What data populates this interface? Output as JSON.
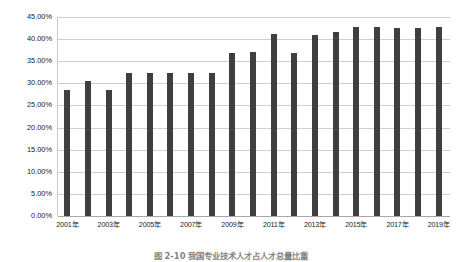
{
  "chart_data": {
    "type": "bar",
    "title": "",
    "xlabel": "",
    "ylabel": "",
    "ylim": [
      0,
      45
    ],
    "grid": true,
    "legend": "none",
    "y_ticks": [
      "0.00%",
      "5.00%",
      "10.00%",
      "15.00%",
      "20.00%",
      "25.00%",
      "30.00%",
      "35.00%",
      "40.00%",
      "45.00%"
    ],
    "y_tick_values": [
      0,
      5,
      10,
      15,
      20,
      25,
      30,
      35,
      40,
      45
    ],
    "categories": [
      "2001年",
      "2002年",
      "2003年",
      "2004年",
      "2005年",
      "2006年",
      "2007年",
      "2008年",
      "2009年",
      "2010年",
      "2011年",
      "2012年",
      "2013年",
      "2014年",
      "2015年",
      "2016年",
      "2017年",
      "2018年",
      "2019年"
    ],
    "visible_x_tick_labels": [
      "2001年",
      "2003年",
      "2005年",
      "2007年",
      "2009年",
      "2011年",
      "2013年",
      "2015年",
      "2017年",
      "2019年"
    ],
    "values": [
      28.5,
      30.6,
      28.5,
      32.3,
      32.3,
      32.3,
      32.3,
      32.3,
      36.9,
      37.0,
      41.2,
      36.9,
      41.0,
      41.6,
      42.8,
      42.8,
      42.5,
      42.6,
      42.8
    ],
    "series": [
      {
        "name": "比重",
        "color": "#3f3f3f",
        "values": [
          28.5,
          30.6,
          28.5,
          32.3,
          32.3,
          32.3,
          32.3,
          32.3,
          36.9,
          37.0,
          41.2,
          36.9,
          41.0,
          41.6,
          42.8,
          42.8,
          42.5,
          42.6,
          42.8
        ]
      }
    ]
  },
  "caption": {
    "text": "图 2-10  我国专业技术人才占人才总量比重"
  },
  "colors": {
    "bar": "#3f3f3f",
    "gridline": "#cfcfcf",
    "axis": "#a8a8a8",
    "background": "#ffffff",
    "text": "#1d1d1d"
  }
}
